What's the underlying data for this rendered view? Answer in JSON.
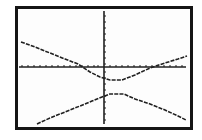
{
  "screen": {
    "type": "graphing-calculator-graph-screen",
    "frame_color": "#151515",
    "background_color": "#fdfdfd",
    "plot_color": "#202020"
  },
  "graph": {
    "description": "Hyperbola with two branches opening up/down, graphed on a calculator screen",
    "axes": {
      "x_axis_y_px": 67,
      "y_axis_x_px": 104,
      "x_ticks_px": [
        22,
        28,
        34,
        40,
        46,
        52,
        58,
        64,
        70,
        76,
        82,
        88,
        94,
        98,
        110,
        116,
        122,
        128,
        134,
        140,
        146,
        152,
        158,
        164,
        170,
        176,
        182
      ],
      "y_ticks_px": [
        16,
        22,
        28,
        34,
        40,
        46,
        52,
        58,
        64,
        72,
        78,
        84,
        90,
        96,
        102,
        108,
        114,
        120
      ]
    },
    "upper_branch_points": [
      [
        21,
        42
      ],
      [
        35,
        47
      ],
      [
        50,
        53
      ],
      [
        65,
        59
      ],
      [
        78,
        64
      ],
      [
        90,
        72
      ],
      [
        100,
        77
      ],
      [
        110,
        80
      ],
      [
        122,
        80
      ],
      [
        135,
        75
      ],
      [
        150,
        68
      ],
      [
        165,
        63
      ],
      [
        178,
        59
      ],
      [
        187,
        56
      ]
    ],
    "lower_branch_points": [
      [
        37,
        124
      ],
      [
        50,
        118
      ],
      [
        65,
        112
      ],
      [
        80,
        106
      ],
      [
        92,
        101
      ],
      [
        102,
        97
      ],
      [
        110,
        94
      ],
      [
        124,
        94
      ],
      [
        135,
        99
      ],
      [
        150,
        104
      ],
      [
        165,
        110
      ],
      [
        178,
        116
      ],
      [
        186,
        120
      ]
    ]
  },
  "chart_data": {
    "type": "line",
    "title": "",
    "xlabel": "",
    "ylabel": "",
    "grid": false,
    "series": [
      {
        "name": "upper branch",
        "x": [
          -8,
          -6,
          -4,
          -2,
          -1,
          0,
          1,
          2,
          4,
          6,
          8
        ],
        "y": [
          2.2,
          1.5,
          0.6,
          0,
          -0.5,
          -0.8,
          -0.8,
          -0.5,
          0.1,
          0.7,
          1.2
        ]
      },
      {
        "name": "lower branch",
        "x": [
          -6,
          -4,
          -2,
          0,
          1,
          2,
          4,
          6,
          8
        ],
        "y": [
          -5.5,
          -4.4,
          -3.4,
          -2.8,
          -2.6,
          -2.6,
          -3.2,
          -4.2,
          -5.0
        ]
      }
    ]
  }
}
